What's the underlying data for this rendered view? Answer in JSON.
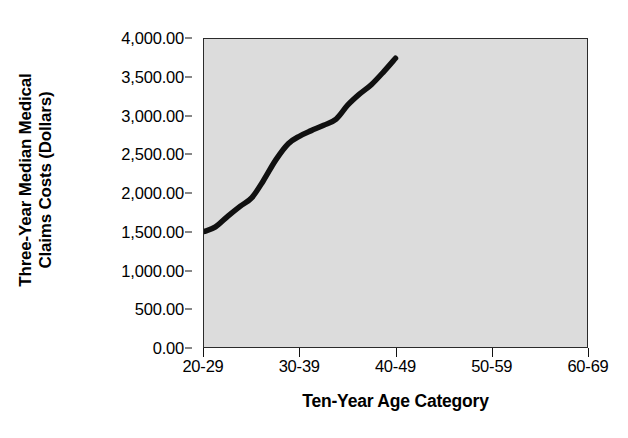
{
  "chart_data": {
    "type": "line",
    "title": "",
    "subtitle": "",
    "xlabel": "Ten-Year Age Category",
    "ylabel": "Three-Year Median Medical Claims Costs (Dollars)",
    "ylabel_lines": [
      "Three-Year Median Medical",
      "Claims Costs (Dollars)"
    ],
    "categories": [
      "20-29",
      "30-39",
      "40-49",
      "50-59",
      "60-69"
    ],
    "values": [
      1500,
      1940,
      2740,
      3140,
      3750
    ],
    "series": [
      {
        "name": "Three-Year Median Medical Claims Costs",
        "values": [
          1500,
          1940,
          2740,
          3140,
          3750
        ]
      }
    ],
    "ylim": [
      0,
      4000
    ],
    "ytick_values": [
      0,
      500,
      1000,
      1500,
      2000,
      2500,
      3000,
      3500,
      4000
    ],
    "ytick_labels": [
      "0.00",
      "500.00",
      "1,000.00",
      "1,500.00",
      "2,000.00",
      "2,500.00",
      "3,000.00",
      "3,500.00",
      "4,000.00"
    ],
    "grid": false,
    "legend": false,
    "legend_position": "none",
    "line_color": "#101010",
    "plot_background_color": "#dcdcdc",
    "figure_background_color": "#ffffff",
    "axis_color": "#2b2b2b",
    "curve_points": [
      {
        "x": 0.0,
        "y": 1500
      },
      {
        "x": 0.12,
        "y": 1560
      },
      {
        "x": 0.25,
        "y": 1700
      },
      {
        "x": 0.38,
        "y": 1830
      },
      {
        "x": 0.5,
        "y": 1940
      },
      {
        "x": 0.62,
        "y": 2160
      },
      {
        "x": 0.75,
        "y": 2430
      },
      {
        "x": 0.88,
        "y": 2640
      },
      {
        "x": 1.0,
        "y": 2740
      },
      {
        "x": 1.12,
        "y": 2810
      },
      {
        "x": 1.25,
        "y": 2880
      },
      {
        "x": 1.38,
        "y": 2960
      },
      {
        "x": 1.5,
        "y": 3140
      },
      {
        "x": 1.62,
        "y": 3280
      },
      {
        "x": 1.75,
        "y": 3410
      },
      {
        "x": 1.88,
        "y": 3580
      },
      {
        "x": 2.0,
        "y": 3750
      }
    ]
  }
}
